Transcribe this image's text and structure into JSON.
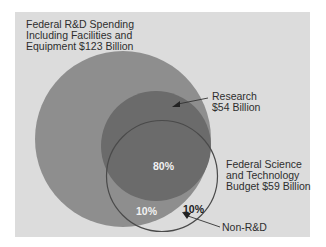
{
  "diagram": {
    "type": "venn",
    "colors": {
      "background": "#dcdcdc",
      "rd_total_fill": "#8e8e8e",
      "research_fill": "#6b6b6b",
      "st_budget_outline": "#4a4a4a",
      "label_text": "#2e2e2e",
      "pct_light": "#f2f2f2",
      "pct_dark": "#222222"
    },
    "sets": [
      {
        "id": "rd_total",
        "label_lines": [
          "Federal R&D Spending",
          "Including Facilities and",
          "Equipment $123 Billion"
        ],
        "value_billion": 123
      },
      {
        "id": "research",
        "label_lines": [
          "Research",
          "$54 Billion"
        ],
        "value_billion": 54
      },
      {
        "id": "st_budget",
        "label_lines": [
          "Federal Science",
          "and Technology",
          "Budget $59 Billion"
        ],
        "value_billion": 59
      }
    ],
    "regions": [
      {
        "id": "st_research",
        "label": "80%"
      },
      {
        "id": "st_other_rd",
        "label": "10%"
      },
      {
        "id": "st_non_rd",
        "label": "10%"
      }
    ],
    "callouts": [
      {
        "id": "non_rd",
        "label": "Non-R&D"
      }
    ]
  }
}
